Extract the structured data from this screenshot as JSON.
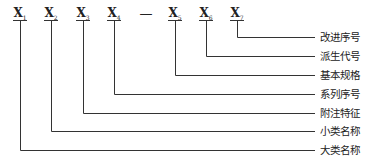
{
  "codes": [
    {
      "base": "X",
      "sub": "1",
      "x": 20
    },
    {
      "base": "X",
      "sub": "2",
      "x": 51
    },
    {
      "base": "X",
      "sub": "3",
      "x": 83
    },
    {
      "base": "X",
      "sub": "4",
      "x": 114
    },
    {
      "base": "X",
      "sub": "5",
      "x": 175
    },
    {
      "base": "X",
      "sub": "6",
      "x": 206
    },
    {
      "base": "X",
      "sub": "7",
      "x": 237
    }
  ],
  "separator": "—",
  "labels": [
    {
      "text": "改进序号",
      "y": 37
    },
    {
      "text": "派生代号",
      "y": 56
    },
    {
      "text": "基本规格",
      "y": 75
    },
    {
      "text": "系列序号",
      "y": 94
    },
    {
      "text": "附注特征",
      "y": 113
    },
    {
      "text": "小类名称",
      "y": 131
    },
    {
      "text": "大类名称",
      "y": 150
    }
  ]
}
